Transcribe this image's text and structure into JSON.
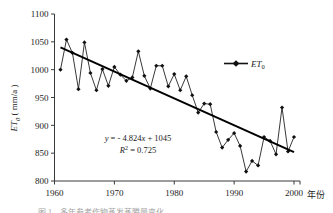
{
  "chart_data": {
    "type": "line",
    "title": "",
    "xlabel": "年份",
    "ylabel": "ET₀ (mm/a)",
    "ylabel_base": "ET",
    "ylabel_sub": "0",
    "ylabel_unit": "( mm/a )",
    "xlim": [
      1960,
      2001
    ],
    "ylim": [
      800,
      1100
    ],
    "yticks": [
      800,
      850,
      900,
      950,
      1000,
      1050,
      1100
    ],
    "xticks": [
      1960,
      1970,
      1980,
      1990,
      2000
    ],
    "grid": false,
    "legend_position": "top-right",
    "series": [
      {
        "name": "ET₀",
        "name_base": "ET",
        "name_sub": "0",
        "marker": "diamond",
        "color": "#111111",
        "x": [
          1961,
          1962,
          1963,
          1964,
          1965,
          1966,
          1967,
          1968,
          1969,
          1970,
          1971,
          1972,
          1973,
          1974,
          1975,
          1976,
          1977,
          1978,
          1979,
          1980,
          1981,
          1982,
          1983,
          1984,
          1985,
          1986,
          1987,
          1988,
          1989,
          1990,
          1991,
          1992,
          1993,
          1994,
          1995,
          1996,
          1997,
          1998,
          1999,
          2000
        ],
        "values": [
          1000,
          1054,
          1030,
          965,
          1049,
          994,
          963,
          1001,
          971,
          1005,
          991,
          980,
          986,
          1033,
          989,
          966,
          1007,
          1007,
          970,
          992,
          963,
          988,
          954,
          923,
          939,
          938,
          888,
          860,
          874,
          886,
          863,
          817,
          836,
          828,
          879,
          872,
          848,
          932,
          853,
          879
        ]
      }
    ],
    "trendline": {
      "name": "linear-trend",
      "equation": "y = - 4.824x + 1045",
      "equation_parts": {
        "y": "y",
        "eq": "= - 4.824",
        "x": "x",
        "intercept": "+ 1045"
      },
      "r_squared_label": "R",
      "r_squared_sup": "2",
      "r_squared_value": "= 0.725",
      "slope": -4.824,
      "intercept": 1045,
      "r2": 0.725,
      "x_start": 1961,
      "x_end": 2000,
      "y_start": 1040,
      "y_end": 852
    },
    "annotations": [
      {
        "name": "regression-equation",
        "text": "y = - 4.824x + 1045"
      },
      {
        "name": "r-squared",
        "text": "R² = 0.725"
      }
    ]
  },
  "figure": {
    "caption": "图 1　多年参考作物蒸发蒸腾量变化"
  }
}
